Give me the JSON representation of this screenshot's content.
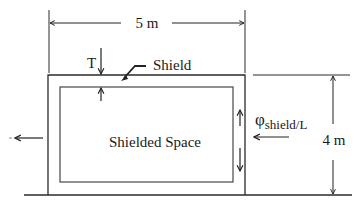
{
  "diagram": {
    "labels": {
      "width": "5 m",
      "height": "4 m",
      "thickness": "T",
      "shield": "Shield",
      "space": "Shielded Space",
      "flux_symbol": "φ",
      "flux_subscript": "shield/L"
    },
    "colors": {
      "line": "#2a2a2a",
      "inner_line": "#555555",
      "background": "#ffffff"
    }
  }
}
